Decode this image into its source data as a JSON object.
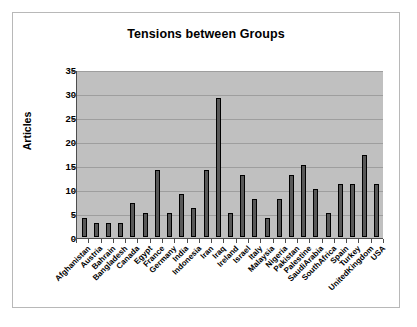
{
  "chart_data": {
    "type": "bar",
    "title": "Tensions between Groups",
    "xlabel": "",
    "ylabel": "Articles",
    "ylim": [
      0,
      35
    ],
    "yticks": [
      0,
      5,
      10,
      15,
      20,
      25,
      30,
      35
    ],
    "grid": true,
    "legend": null,
    "categories": [
      "Afghanistan",
      "Austria",
      "Bahrain",
      "Bangladesh",
      "Canada",
      "Egypt",
      "France",
      "Germany",
      "India",
      "Indonesia",
      "Iran",
      "Iraq",
      "Ireland",
      "Israel",
      "Italy",
      "Malaysia",
      "Nigeria",
      "Pakistan",
      "Palestine",
      "SaudiArabia",
      "SouthAfrica",
      "Spain",
      "Turkey",
      "UnitedKingdom",
      "USA"
    ],
    "values": [
      4,
      3,
      3,
      3,
      7,
      5,
      14,
      5,
      9,
      6,
      14,
      29,
      5,
      13,
      8,
      4,
      8,
      13,
      15,
      10,
      5,
      11,
      11,
      17,
      11
    ],
    "colors": {
      "bar_fill": "#585858",
      "bar_stroke": "#000000",
      "plot_background": "#c0c0c0",
      "gridline": "#9e9e9e",
      "axis": "#4d4d4d",
      "frame": "#b8b8b8",
      "page_background": "#ffffff",
      "text": "#000000"
    }
  }
}
